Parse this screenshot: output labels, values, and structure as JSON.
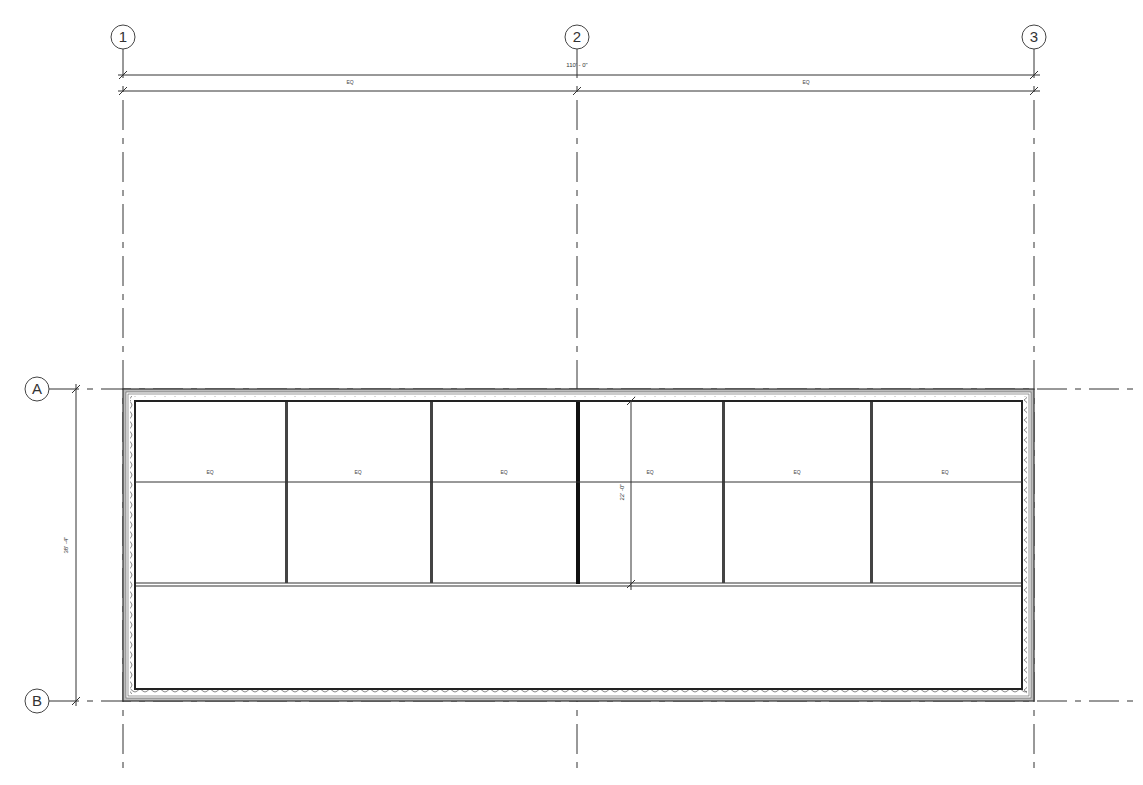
{
  "drawing": {
    "type": "floor-plan",
    "line_color": "#333333",
    "wall_fill": "#bbbbbb"
  },
  "grids": {
    "vertical": [
      {
        "label": "1",
        "x": 123
      },
      {
        "label": "2",
        "x": 577
      },
      {
        "label": "3",
        "x": 1034
      }
    ],
    "horizontal": [
      {
        "label": "A",
        "y": 389
      },
      {
        "label": "B",
        "y": 701
      }
    ]
  },
  "dimensions": {
    "overall_width": "110' - 0\"",
    "top_segments": [
      "EQ",
      "EQ"
    ],
    "overall_height": "38' -4\"",
    "bay_depth": "22' -0\"",
    "bay_labels": [
      "EQ",
      "EQ",
      "EQ",
      "EQ",
      "EQ",
      "EQ"
    ]
  }
}
